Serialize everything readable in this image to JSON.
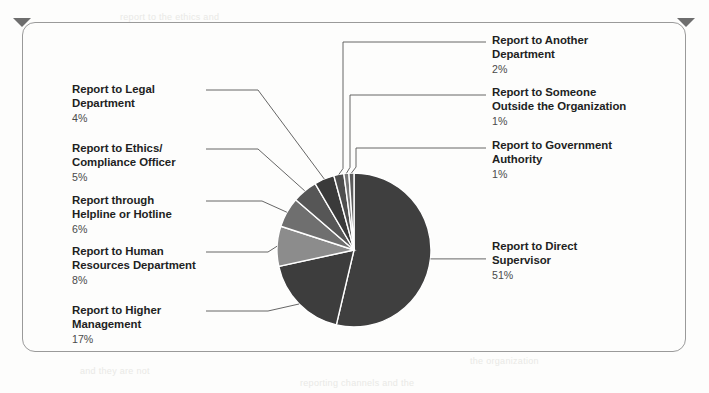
{
  "chart_data": {
    "type": "pie",
    "title": "",
    "legend_position": "callout-labels",
    "unit": "%",
    "categories": [
      "Report to Direct Supervisor",
      "Report to Higher Management",
      "Report to Human Resources Department",
      "Report through Helpline or Hotline",
      "Report to Ethics/Compliance Officer",
      "Report to Legal Department",
      "Report to Another Department",
      "Report to Someone Outside the Organization",
      "Report to Government Authority"
    ],
    "values": [
      51,
      17,
      8,
      6,
      5,
      4,
      2,
      1,
      1
    ],
    "labels": [
      "51%",
      "17%",
      "8%",
      "6%",
      "5%",
      "4%",
      "2%",
      "1%",
      "1%"
    ],
    "colors": [
      "#3f3f3f",
      "#3d3d3d",
      "#8c8c8c",
      "#6f6f6f",
      "#565656",
      "#3a3a3a",
      "#4e4e4e",
      "#777777",
      "#5c5c5c"
    ],
    "start_angle_deg": 0,
    "direction": "clockwise"
  },
  "slices": [
    {
      "name": "direct-supervisor",
      "title_line1": "Report to Direct",
      "title_line2": "Supervisor",
      "percent": "51%"
    },
    {
      "name": "higher-management",
      "title_line1": "Report to Higher",
      "title_line2": "Management",
      "percent": "17%"
    },
    {
      "name": "human-resources",
      "title_line1": "Report to Human",
      "title_line2": "Resources Department",
      "percent": "8%"
    },
    {
      "name": "helpline-hotline",
      "title_line1": "Report through",
      "title_line2": "Helpline or Hotline",
      "percent": "6%"
    },
    {
      "name": "ethics-compliance-officer",
      "title_line1": "Report to Ethics/",
      "title_line2": "Compliance Officer",
      "percent": "5%"
    },
    {
      "name": "legal-department",
      "title_line1": "Report to Legal",
      "title_line2": "Department",
      "percent": "4%"
    },
    {
      "name": "another-department",
      "title_line1": "Report to Another",
      "title_line2": "Department",
      "percent": "2%"
    },
    {
      "name": "someone-outside-organization",
      "title_line1": "Report to Someone",
      "title_line2": "Outside the Organization",
      "percent": "1%"
    },
    {
      "name": "government-authority",
      "title_line1": "Report to Government",
      "title_line2": "Authority",
      "percent": "1%"
    }
  ],
  "frame": {
    "border_color": "#9a9a9a",
    "pin_color": "#6e6e6e"
  },
  "bleed_text": {
    "line1": "report to the ethics and",
    "line2": "the organization",
    "line3": "and they are not",
    "line4": "reporting channels and the"
  }
}
